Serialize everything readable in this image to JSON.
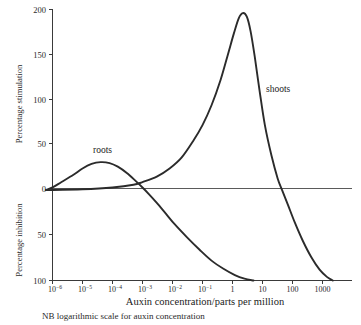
{
  "chart_data": {
    "type": "line",
    "title": "",
    "xlabel": "Auxin concentration/parts per million",
    "ylabel_upper": "Percentage stimulation",
    "ylabel_lower": "Percentage inhibition",
    "note": "NB logarithmic scale for auxin concentration",
    "x_scale": "log",
    "xlim": [
      4e-07,
      10000
    ],
    "ylim": [
      -100,
      200
    ],
    "grid": false,
    "legend_position": "inline-annotation",
    "x_ticks": [
      {
        "label_base": "10",
        "label_exp": "−6",
        "value": 1e-06
      },
      {
        "label_base": "10",
        "label_exp": "−5",
        "value": 1e-05
      },
      {
        "label_base": "10",
        "label_exp": "−4",
        "value": 0.0001
      },
      {
        "label_base": "10",
        "label_exp": "−3",
        "value": 0.001
      },
      {
        "label_base": "10",
        "label_exp": "−2",
        "value": 0.01
      },
      {
        "label_base": "10",
        "label_exp": "−1",
        "value": 0.1
      },
      {
        "label_base": "1",
        "label_exp": "",
        "value": 1
      },
      {
        "label_base": "10",
        "label_exp": "",
        "value": 10
      },
      {
        "label_base": "100",
        "label_exp": "",
        "value": 100
      },
      {
        "label_base": "1000",
        "label_exp": "",
        "value": 1000
      }
    ],
    "y_ticks_upper": [
      {
        "label": "200",
        "value": 200
      },
      {
        "label": "150",
        "value": 150
      },
      {
        "label": "100",
        "value": 100
      },
      {
        "label": "50",
        "value": 50
      },
      {
        "label": "0",
        "value": 0
      }
    ],
    "y_ticks_lower": [
      {
        "label": "50",
        "value": -50
      },
      {
        "label": "100",
        "value": -100
      }
    ],
    "series": [
      {
        "name": "roots",
        "annotation": "roots",
        "points": [
          {
            "x": 6e-07,
            "y": 0
          },
          {
            "x": 1e-06,
            "y": 3
          },
          {
            "x": 2e-06,
            "y": 9
          },
          {
            "x": 5e-06,
            "y": 17
          },
          {
            "x": 1e-05,
            "y": 24
          },
          {
            "x": 2e-05,
            "y": 29
          },
          {
            "x": 4e-05,
            "y": 31
          },
          {
            "x": 8e-05,
            "y": 30
          },
          {
            "x": 0.00015,
            "y": 26
          },
          {
            "x": 0.0003,
            "y": 19
          },
          {
            "x": 0.0006,
            "y": 10
          },
          {
            "x": 0.001,
            "y": 3
          },
          {
            "x": 0.0016,
            "y": -4
          },
          {
            "x": 0.003,
            "y": -14
          },
          {
            "x": 0.006,
            "y": -26
          },
          {
            "x": 0.012,
            "y": -38
          },
          {
            "x": 0.03,
            "y": -52
          },
          {
            "x": 0.08,
            "y": -66
          },
          {
            "x": 0.2,
            "y": -78
          },
          {
            "x": 0.5,
            "y": -87
          },
          {
            "x": 1.2,
            "y": -94
          },
          {
            "x": 2.5,
            "y": -98
          },
          {
            "x": 5,
            "y": -100
          }
        ]
      },
      {
        "name": "shoots",
        "annotation": "shoots",
        "points": [
          {
            "x": 6e-07,
            "y": 0
          },
          {
            "x": 1e-05,
            "y": 1
          },
          {
            "x": 0.0001,
            "y": 3
          },
          {
            "x": 0.0005,
            "y": 6
          },
          {
            "x": 0.001,
            "y": 9
          },
          {
            "x": 0.003,
            "y": 15
          },
          {
            "x": 0.008,
            "y": 24
          },
          {
            "x": 0.02,
            "y": 36
          },
          {
            "x": 0.05,
            "y": 55
          },
          {
            "x": 0.1,
            "y": 72
          },
          {
            "x": 0.2,
            "y": 94
          },
          {
            "x": 0.4,
            "y": 122
          },
          {
            "x": 0.7,
            "y": 150
          },
          {
            "x": 1.1,
            "y": 173
          },
          {
            "x": 1.6,
            "y": 190
          },
          {
            "x": 2.2,
            "y": 196
          },
          {
            "x": 3,
            "y": 192
          },
          {
            "x": 4,
            "y": 176
          },
          {
            "x": 5.5,
            "y": 148
          },
          {
            "x": 8,
            "y": 110
          },
          {
            "x": 12,
            "y": 72
          },
          {
            "x": 20,
            "y": 38
          },
          {
            "x": 32,
            "y": 13
          },
          {
            "x": 45,
            "y": 0
          },
          {
            "x": 70,
            "y": -16
          },
          {
            "x": 120,
            "y": -36
          },
          {
            "x": 220,
            "y": -56
          },
          {
            "x": 420,
            "y": -74
          },
          {
            "x": 800,
            "y": -88
          },
          {
            "x": 1400,
            "y": -96
          },
          {
            "x": 2200,
            "y": -100
          }
        ]
      }
    ]
  }
}
